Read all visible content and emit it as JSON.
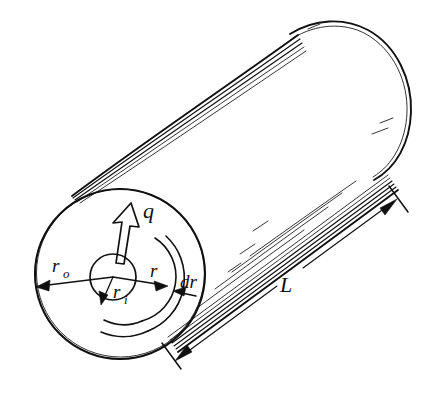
{
  "figure": {
    "title": "Hollow cylinder radial conduction diagram",
    "kind": "engineering-sketch",
    "background_color": "#ffffff",
    "ink_color": "#101010",
    "canvas": {
      "width": 435,
      "height": 414
    }
  },
  "labels": {
    "heat_flux": {
      "text": "q",
      "meaning": "radial heat flow rate",
      "x": 143,
      "y": 218
    },
    "outer_radius": {
      "text": "r",
      "subscript": "o",
      "meaning": "outer radius of cylinder",
      "x": 52,
      "y": 272
    },
    "inner_radius": {
      "text": "r",
      "subscript": "i",
      "meaning": "inner radius of cylinder",
      "x": 116,
      "y": 297
    },
    "radius": {
      "text": "r",
      "meaning": "generic radius to the differential element",
      "x": 152,
      "y": 278
    },
    "thickness": {
      "text": "dr",
      "meaning": "differential radial thickness of the shell element",
      "x": 182,
      "y": 288
    },
    "length": {
      "text": "L",
      "meaning": "length of the cylinder",
      "x": 286,
      "y": 290
    }
  },
  "geometry": {
    "front_face": {
      "center_x": 120,
      "center_y": 274,
      "outer_radius": 85,
      "inner_radius": 23
    },
    "element_band": {
      "inner_arc_radius": 46,
      "outer_arc_radius": 57
    },
    "cylinder_axis_angle_deg": -39,
    "back_face": {
      "center_x": 352,
      "center_y": 103,
      "radius": 85
    }
  },
  "dimension_line": {
    "name": "length-dimension",
    "start": {
      "x": 175,
      "y": 360
    },
    "end": {
      "x": 397,
      "y": 197
    },
    "arrow_heads": 2,
    "label": "L"
  },
  "annotations": [
    {
      "name": "q-arrow",
      "type": "outline-arrow",
      "points_to": "radially outward",
      "interactable": false
    },
    {
      "name": "ro-arrow",
      "type": "dimension-arrow",
      "points_to": "outer circle, left",
      "interactable": false
    },
    {
      "name": "ri-arrow",
      "type": "dimension-arrow",
      "points_to": "inner circle, lower-left",
      "interactable": false
    },
    {
      "name": "r-arrow",
      "type": "dimension-arrow",
      "points_to": "element inner arc, right",
      "interactable": false
    },
    {
      "name": "dr-arrow",
      "type": "dimension-arrow",
      "points_to": "element outer arc, right",
      "interactable": false
    }
  ]
}
